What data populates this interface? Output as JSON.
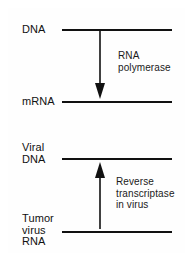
{
  "diagram": {
    "border_color": "#6a6a6a",
    "line_color": "#111111",
    "background_color": "#ffffff",
    "nodes": [
      {
        "id": "dna",
        "label": "DNA",
        "label_x": 22,
        "label_y": 24,
        "line_x": 62,
        "line_y": 29,
        "line_w": 110
      },
      {
        "id": "mrna",
        "label": "mRNA",
        "label_x": 22,
        "label_y": 96,
        "line_x": 62,
        "line_y": 101,
        "line_w": 110
      },
      {
        "id": "viral-dna",
        "label": "Viral\nDNA",
        "label_x": 22,
        "label_y": 142,
        "line_x": 62,
        "line_y": 158,
        "line_w": 110
      },
      {
        "id": "tumor-rna",
        "label": "Tumor\nvirus\nRNA",
        "label_x": 22,
        "label_y": 213,
        "line_x": 62,
        "line_y": 231,
        "line_w": 110
      }
    ],
    "arrows": [
      {
        "id": "transcription-arrow",
        "direction": "down",
        "from_node": "dna",
        "to_node": "mrna",
        "x": 100,
        "y_start": 31,
        "y_end": 99,
        "enzyme": "RNA\npolymerase",
        "enzyme_x": 118,
        "enzyme_y": 50
      },
      {
        "id": "reverse-transcription-arrow",
        "direction": "up",
        "from_node": "tumor-rna",
        "to_node": "viral-dna",
        "x": 100,
        "y_start": 229,
        "y_end": 162,
        "enzyme": "Reverse\ntranscriptase\nin virus",
        "enzyme_x": 116,
        "enzyme_y": 176
      }
    ]
  }
}
